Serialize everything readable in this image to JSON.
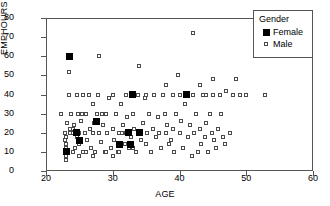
{
  "chart_data": {
    "type": "scatter",
    "title": "",
    "xlabel": "AGE",
    "ylabel": "EMPHOURS",
    "xlim": [
      20,
      60
    ],
    "ylim": [
      0,
      80
    ],
    "xticks": [
      20,
      30,
      40,
      50,
      60
    ],
    "yticks": [
      0,
      10,
      20,
      30,
      40,
      50,
      60,
      70,
      80
    ],
    "grid": false,
    "legend": {
      "title": "Gender",
      "position": "top-right",
      "entries": [
        {
          "name": "Female",
          "marker": "filled-square",
          "color": "#000000"
        },
        {
          "name": "Male",
          "marker": "open-square",
          "color": "#4a4a4a"
        }
      ]
    },
    "series": [
      {
        "name": "Male",
        "marker": "open-square",
        "points": [
          [
            22.2,
            30
          ],
          [
            22.8,
            20
          ],
          [
            22.9,
            16
          ],
          [
            23.0,
            6
          ],
          [
            23.0,
            8
          ],
          [
            23.0,
            10
          ],
          [
            23.0,
            12
          ],
          [
            23.0,
            14
          ],
          [
            23.0,
            18
          ],
          [
            23.2,
            25
          ],
          [
            23.4,
            52
          ],
          [
            23.5,
            40
          ],
          [
            23.8,
            30
          ],
          [
            24.0,
            20
          ],
          [
            24.0,
            10
          ],
          [
            24.2,
            24
          ],
          [
            24.4,
            12
          ],
          [
            24.6,
            40
          ],
          [
            24.8,
            30
          ],
          [
            25.0,
            20
          ],
          [
            25.0,
            14
          ],
          [
            25.2,
            26
          ],
          [
            25.5,
            40
          ],
          [
            25.6,
            10
          ],
          [
            25.8,
            20
          ],
          [
            26.0,
            30
          ],
          [
            26.2,
            16
          ],
          [
            26.5,
            40
          ],
          [
            26.6,
            22
          ],
          [
            26.8,
            12
          ],
          [
            27.0,
            20
          ],
          [
            27.0,
            35
          ],
          [
            27.2,
            25
          ],
          [
            27.4,
            10
          ],
          [
            27.6,
            30
          ],
          [
            27.8,
            40
          ],
          [
            28.0,
            60
          ],
          [
            28.0,
            20
          ],
          [
            28.2,
            15
          ],
          [
            28.5,
            24
          ],
          [
            28.8,
            10
          ],
          [
            29.0,
            30
          ],
          [
            29.2,
            20
          ],
          [
            29.5,
            38
          ],
          [
            29.8,
            12
          ],
          [
            30.0,
            40
          ],
          [
            30.0,
            22
          ],
          [
            30.2,
            16
          ],
          [
            30.5,
            30
          ],
          [
            30.8,
            10
          ],
          [
            31.0,
            20
          ],
          [
            31.2,
            35
          ],
          [
            31.5,
            24
          ],
          [
            31.8,
            14
          ],
          [
            32.0,
            40
          ],
          [
            32.0,
            20
          ],
          [
            32.2,
            28
          ],
          [
            32.5,
            12
          ],
          [
            32.8,
            18
          ],
          [
            33.0,
            30
          ],
          [
            33.2,
            22
          ],
          [
            33.5,
            10
          ],
          [
            33.8,
            40
          ],
          [
            34.0,
            55
          ],
          [
            34.0,
            20
          ],
          [
            34.2,
            16
          ],
          [
            34.5,
            25
          ],
          [
            34.8,
            38
          ],
          [
            35.0,
            40
          ],
          [
            35.0,
            14
          ],
          [
            35.2,
            20
          ],
          [
            35.5,
            30
          ],
          [
            35.8,
            10
          ],
          [
            36.0,
            22
          ],
          [
            36.2,
            40
          ],
          [
            36.5,
            18
          ],
          [
            36.8,
            28
          ],
          [
            37.0,
            20
          ],
          [
            37.2,
            12
          ],
          [
            37.5,
            40
          ],
          [
            37.8,
            30
          ],
          [
            38.0,
            45
          ],
          [
            38.0,
            20
          ],
          [
            38.2,
            24
          ],
          [
            38.5,
            14
          ],
          [
            38.8,
            16
          ],
          [
            39.0,
            40
          ],
          [
            39.0,
            22
          ],
          [
            39.2,
            10
          ],
          [
            39.5,
            30
          ],
          [
            39.8,
            50
          ],
          [
            40.0,
            40
          ],
          [
            40.0,
            20
          ],
          [
            40.2,
            26
          ],
          [
            40.5,
            12
          ],
          [
            40.8,
            35
          ],
          [
            41.0,
            40
          ],
          [
            41.2,
            18
          ],
          [
            41.5,
            24
          ],
          [
            41.8,
            8
          ],
          [
            42.0,
            72
          ],
          [
            42.0,
            40
          ],
          [
            42.2,
            20
          ],
          [
            42.5,
            30
          ],
          [
            42.8,
            10
          ],
          [
            43.0,
            45
          ],
          [
            43.0,
            22
          ],
          [
            43.2,
            14
          ],
          [
            43.5,
            40
          ],
          [
            43.8,
            18
          ],
          [
            44.0,
            40
          ],
          [
            44.0,
            25
          ],
          [
            44.2,
            10
          ],
          [
            44.5,
            30
          ],
          [
            44.8,
            20
          ],
          [
            45.0,
            48
          ],
          [
            45.0,
            40
          ],
          [
            45.2,
            16
          ],
          [
            45.5,
            12
          ],
          [
            45.8,
            22
          ],
          [
            46.0,
            40
          ],
          [
            46.2,
            30
          ],
          [
            46.5,
            18
          ],
          [
            46.8,
            14
          ],
          [
            47.0,
            42
          ],
          [
            47.5,
            20
          ],
          [
            48.0,
            40
          ],
          [
            48.5,
            48
          ],
          [
            49.0,
            40
          ],
          [
            50.0,
            40
          ],
          [
            52.8,
            40
          ],
          [
            24.0,
            22
          ],
          [
            24.6,
            18
          ],
          [
            25.0,
            8
          ],
          [
            26.0,
            10
          ],
          [
            27.0,
            8
          ],
          [
            29.0,
            10
          ],
          [
            30.0,
            8
          ],
          [
            31.0,
            10
          ],
          [
            33.0,
            12
          ],
          [
            23.6,
            20
          ],
          [
            23.6,
            22
          ],
          [
            25.4,
            30
          ],
          [
            28.4,
            30
          ],
          [
            31.4,
            20
          ]
        ]
      },
      {
        "name": "Female",
        "marker": "filled-square",
        "points": [
          [
            23.5,
            60
          ],
          [
            23.0,
            10
          ],
          [
            24.6,
            20
          ],
          [
            25.0,
            16
          ],
          [
            27.5,
            26
          ],
          [
            33.0,
            40
          ],
          [
            32.4,
            20
          ],
          [
            32.6,
            14
          ],
          [
            41.0,
            40
          ],
          [
            34.0,
            20
          ],
          [
            31.0,
            14
          ]
        ]
      }
    ]
  },
  "axes": {
    "y_ticks": [
      "80",
      "70",
      "60",
      "50",
      "40",
      "30",
      "20",
      "10",
      "0"
    ],
    "x_ticks": [
      "20",
      "30",
      "40",
      "50",
      "60"
    ],
    "y_title": "EMPHOURS",
    "x_title": "AGE"
  },
  "legend": {
    "title": "Gender",
    "female_label": "Female",
    "male_label": "Male"
  }
}
